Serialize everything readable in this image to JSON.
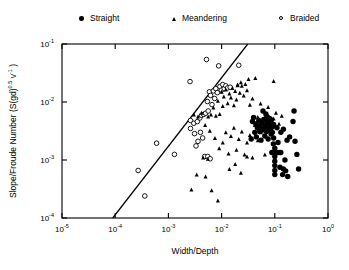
{
  "legend": {
    "position": "top",
    "entries": [
      {
        "label": "Straight",
        "marker": "filled-circle"
      },
      {
        "label": "Meandering",
        "marker": "filled-triangle"
      },
      {
        "label": "Braided",
        "marker": "open-circle"
      }
    ]
  },
  "axes": {
    "x_title_a": "Width/",
    "x_title_b": "Depth",
    "y_title_main": "Slope/Froude Number (S(gd)",
    "y_title_exp1": "0.5",
    "y_title_mid": " v",
    "y_title_exp2": "-1",
    "y_title_end": " )",
    "x_ticks": [
      "-5",
      "-4",
      "-3",
      "-2",
      "-1",
      "0"
    ],
    "y_ticks": [
      "-1",
      "-2",
      "-3",
      "-4"
    ],
    "base": "10"
  },
  "chart_data": {
    "type": "scatter",
    "title": "",
    "xlabel": "Width/Depth",
    "ylabel": "Slope/Froude Number (S(gd)^0.5 v^-1)",
    "xscale": "log",
    "yscale": "log",
    "xlim": [
      1e-05,
      1
    ],
    "ylim": [
      0.0001,
      0.1
    ],
    "grid": false,
    "legend_position": "top",
    "annotations": [
      {
        "type": "line",
        "name": "discriminant-line",
        "x": [
          9e-05,
          0.031
        ],
        "y": [
          0.0001,
          0.1
        ]
      }
    ],
    "series": [
      {
        "name": "Braided",
        "marker": "open-circle",
        "color": "#000000",
        "points": [
          [
            0.00027,
            0.00066
          ],
          [
            0.0006,
            0.00195
          ],
          [
            0.00036,
            0.00024
          ],
          [
            0.0013,
            0.00125
          ],
          [
            0.0026,
            0.0048
          ],
          [
            0.0026,
            0.0035
          ],
          [
            0.00255,
            0.0225
          ],
          [
            0.003,
            0.0043
          ],
          [
            0.0031,
            0.00285
          ],
          [
            0.0033,
            0.00175
          ],
          [
            0.0035,
            0.0046
          ],
          [
            0.0036,
            0.0021
          ],
          [
            0.0039,
            0.0053
          ],
          [
            0.004,
            0.003
          ],
          [
            0.0042,
            0.0059
          ],
          [
            0.0044,
            0.0024
          ],
          [
            0.0046,
            0.0061
          ],
          [
            0.0048,
            0.00115
          ],
          [
            0.005,
            0.0064
          ],
          [
            0.0052,
            0.054
          ],
          [
            0.0054,
            0.0102
          ],
          [
            0.0056,
            0.007
          ],
          [
            0.0059,
            0.015
          ],
          [
            0.0062,
            0.013
          ],
          [
            0.0066,
            0.009
          ],
          [
            0.007,
            0.0155
          ],
          [
            0.0074,
            0.0115
          ],
          [
            0.0078,
            0.017
          ],
          [
            0.0083,
            0.0145
          ],
          [
            0.0088,
            0.042
          ],
          [
            0.0093,
            0.0185
          ],
          [
            0.0099,
            0.016
          ],
          [
            0.0105,
            0.02
          ],
          [
            0.0112,
            0.017
          ],
          [
            0.012,
            0.019
          ],
          [
            0.013,
            0.0175
          ],
          [
            0.0145,
            0.018
          ],
          [
            0.021,
            0.043
          ],
          [
            0.0055,
            0.00115
          ],
          [
            0.0061,
            0.00105
          ]
        ]
      },
      {
        "name": "Meandering",
        "marker": "filled-triangle",
        "color": "#000000",
        "points": [
          [
            0.003,
            0.0061
          ],
          [
            0.0036,
            0.0056
          ],
          [
            0.0042,
            0.0065
          ],
          [
            0.0049,
            0.004
          ],
          [
            0.0056,
            0.0056
          ],
          [
            0.0063,
            0.0061
          ],
          [
            0.007,
            0.008
          ],
          [
            0.0078,
            0.0058
          ],
          [
            0.0085,
            0.0105
          ],
          [
            0.0092,
            0.0062
          ],
          [
            0.01,
            0.015
          ],
          [
            0.0105,
            0.0085
          ],
          [
            0.011,
            0.0125
          ],
          [
            0.012,
            0.0165
          ],
          [
            0.013,
            0.0095
          ],
          [
            0.014,
            0.014
          ],
          [
            0.015,
            0.012
          ],
          [
            0.016,
            0.0175
          ],
          [
            0.017,
            0.0088
          ],
          [
            0.018,
            0.0155
          ],
          [
            0.019,
            0.011
          ],
          [
            0.02,
            0.02
          ],
          [
            0.022,
            0.0145
          ],
          [
            0.024,
            0.019
          ],
          [
            0.026,
            0.013
          ],
          [
            0.028,
            0.0205
          ],
          [
            0.03,
            0.016
          ],
          [
            0.034,
            0.009
          ],
          [
            0.038,
            0.0115
          ],
          [
            0.043,
            0.026
          ],
          [
            0.048,
            0.0055
          ],
          [
            0.054,
            0.0094
          ],
          [
            0.06,
            0.0046
          ],
          [
            0.068,
            0.006
          ],
          [
            0.075,
            0.0082
          ],
          [
            0.085,
            0.0034
          ],
          [
            0.095,
            0.0052
          ],
          [
            0.105,
            0.0065
          ],
          [
            0.12,
            0.0042
          ],
          [
            0.135,
            0.0058
          ],
          [
            0.006,
            0.0032
          ],
          [
            0.0075,
            0.0024
          ],
          [
            0.009,
            0.0016
          ],
          [
            0.0105,
            0.002
          ],
          [
            0.012,
            0.003
          ],
          [
            0.0135,
            0.0013
          ],
          [
            0.015,
            0.0026
          ],
          [
            0.017,
            0.0036
          ],
          [
            0.019,
            0.0015
          ],
          [
            0.021,
            0.0023
          ],
          [
            0.024,
            0.0031
          ],
          [
            0.027,
            0.00125
          ],
          [
            0.03,
            0.002
          ],
          [
            0.034,
            0.0027
          ],
          [
            0.038,
            0.0011
          ],
          [
            0.042,
            0.004
          ],
          [
            0.048,
            0.0022
          ],
          [
            0.055,
            0.003
          ],
          [
            0.065,
            0.00125
          ],
          [
            0.0027,
            0.00031
          ],
          [
            0.0034,
            0.00056
          ],
          [
            0.005,
            0.00052
          ],
          [
            0.0065,
            0.0003
          ],
          [
            0.0085,
            0.0002
          ],
          [
            0.014,
            0.0007
          ],
          [
            0.018,
            0.00085
          ],
          [
            0.023,
            0.0006
          ],
          [
            0.03,
            0.00115
          ],
          [
            0.0045,
            0.0011
          ],
          [
            0.0055,
            0.00105
          ],
          [
            0.02,
            0.0195
          ],
          [
            0.023,
            0.022
          ],
          [
            0.032,
            0.025
          ],
          [
            0.095,
            0.023
          ]
        ]
      },
      {
        "name": "Straight",
        "marker": "filled-circle",
        "color": "#000000",
        "points": [
          [
            0.04,
            0.0054
          ],
          [
            0.044,
            0.0042
          ],
          [
            0.047,
            0.0036
          ],
          [
            0.05,
            0.0048
          ],
          [
            0.053,
            0.0039
          ],
          [
            0.056,
            0.0044
          ],
          [
            0.059,
            0.0033
          ],
          [
            0.062,
            0.005
          ],
          [
            0.065,
            0.004
          ],
          [
            0.068,
            0.0035
          ],
          [
            0.071,
            0.0046
          ],
          [
            0.075,
            0.0038
          ],
          [
            0.078,
            0.0043
          ],
          [
            0.082,
            0.0032
          ],
          [
            0.086,
            0.0049
          ],
          [
            0.09,
            0.0037
          ],
          [
            0.095,
            0.0041
          ],
          [
            0.045,
            0.0025
          ],
          [
            0.055,
            0.0022
          ],
          [
            0.065,
            0.0026
          ],
          [
            0.075,
            0.0023
          ],
          [
            0.085,
            0.0028
          ],
          [
            0.095,
            0.0024
          ],
          [
            0.036,
            0.0023
          ],
          [
            0.1,
            0.00135
          ],
          [
            0.1,
            0.00115
          ],
          [
            0.1,
            0.00095
          ],
          [
            0.1,
            0.0008
          ],
          [
            0.1,
            0.00066
          ],
          [
            0.1,
            0.00056
          ],
          [
            0.1,
            0.0016
          ],
          [
            0.11,
            0.00135
          ],
          [
            0.12,
            0.00135
          ],
          [
            0.13,
            0.00135
          ],
          [
            0.088,
            0.00135
          ],
          [
            0.094,
            0.0019
          ],
          [
            0.115,
            0.002
          ],
          [
            0.125,
            0.00075
          ],
          [
            0.145,
            0.0007
          ],
          [
            0.16,
            0.00065
          ],
          [
            0.175,
            0.00052
          ],
          [
            0.14,
            0.00056
          ],
          [
            0.155,
            0.001
          ],
          [
            0.17,
            0.0022
          ],
          [
            0.19,
            0.0025
          ],
          [
            0.22,
            0.0046
          ],
          [
            0.23,
            0.007
          ],
          [
            0.24,
            0.0021
          ],
          [
            0.26,
            0.00125
          ],
          [
            0.28,
            0.0007
          ],
          [
            0.145,
            0.0034
          ],
          [
            0.13,
            0.003
          ],
          [
            0.11,
            0.0036
          ],
          [
            0.06,
            0.007
          ],
          [
            0.068,
            0.0062
          ],
          [
            0.072,
            0.0056
          ],
          [
            0.08,
            0.0052
          ],
          [
            0.038,
            0.0046
          ],
          [
            0.042,
            0.003
          ],
          [
            0.052,
            0.0031
          ],
          [
            0.06,
            0.0034
          ],
          [
            0.07,
            0.0031
          ],
          [
            0.082,
            0.0036
          ],
          [
            0.09,
            0.003
          ]
        ]
      }
    ]
  }
}
